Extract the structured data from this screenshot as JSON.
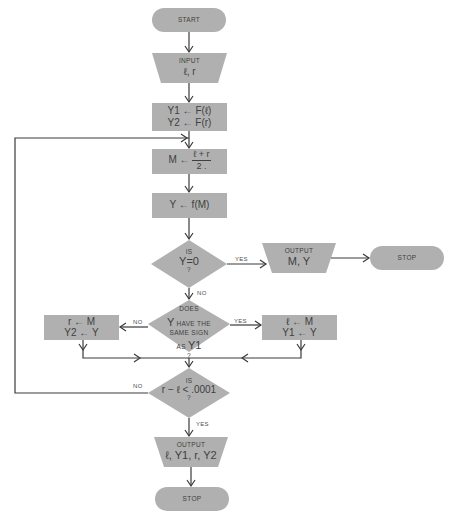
{
  "diagram": {
    "type": "flowchart",
    "colors": {
      "shape_fill": "#b0b0b0",
      "line": "#3a3a3a",
      "text": "#404040",
      "background": "#ffffff"
    },
    "nodes": {
      "start": {
        "shape": "terminal",
        "label": "START"
      },
      "input": {
        "shape": "trapezoid",
        "title": "INPUT",
        "value": "ℓ, r"
      },
      "init": {
        "shape": "process",
        "line1": "Y1 ← F(ℓ)",
        "line2": "Y2 ← F(r)"
      },
      "midpoint": {
        "shape": "process",
        "lhs": "M ←",
        "numerator": "ℓ + r",
        "denominator": "2 ."
      },
      "evaluate": {
        "shape": "process",
        "label": "Y ← f(M)"
      },
      "is_zero": {
        "shape": "decision",
        "top": "IS",
        "main": "Y=0",
        "bottom": "?"
      },
      "output_root": {
        "shape": "trapezoid",
        "title": "OUTPUT",
        "value": "M, Y"
      },
      "stop_root": {
        "shape": "terminal",
        "label": "STOP"
      },
      "same_sign": {
        "shape": "decision",
        "line1": "DOES",
        "line2_big": "Y",
        "line2": " HAVE THE",
        "line3": "SAME SIGN",
        "line4": "AS ",
        "line4_big": "Y1",
        "bottom": "?"
      },
      "update_right": {
        "shape": "process",
        "line1": "r ← M",
        "line2": "Y2 ← Y"
      },
      "update_left": {
        "shape": "process",
        "line1": "ℓ ← M",
        "line2": "Y1 ← Y"
      },
      "converged": {
        "shape": "decision",
        "top": "IS",
        "main": "r − ℓ < .0001",
        "bottom": "?"
      },
      "output_final": {
        "shape": "trapezoid",
        "title": "OUTPUT",
        "value": "ℓ, Y1, r, Y2"
      },
      "stop_final": {
        "shape": "terminal",
        "label": "STOP"
      }
    },
    "edge_labels": {
      "is_zero_yes": "YES",
      "is_zero_no": "NO",
      "same_sign_no": "NO",
      "same_sign_yes": "YES",
      "converged_no": "NO",
      "converged_yes": "YES"
    },
    "edges": [
      {
        "from": "start",
        "to": "input"
      },
      {
        "from": "input",
        "to": "init"
      },
      {
        "from": "init",
        "to": "midpoint"
      },
      {
        "from": "midpoint",
        "to": "evaluate"
      },
      {
        "from": "evaluate",
        "to": "is_zero"
      },
      {
        "from": "is_zero",
        "to": "output_root",
        "label": "YES"
      },
      {
        "from": "output_root",
        "to": "stop_root"
      },
      {
        "from": "is_zero",
        "to": "same_sign",
        "label": "NO"
      },
      {
        "from": "same_sign",
        "to": "update_right",
        "label": "NO"
      },
      {
        "from": "same_sign",
        "to": "update_left",
        "label": "YES"
      },
      {
        "from": "update_right",
        "to": "converged"
      },
      {
        "from": "update_left",
        "to": "converged"
      },
      {
        "from": "converged",
        "to": "midpoint",
        "label": "NO"
      },
      {
        "from": "converged",
        "to": "output_final",
        "label": "YES"
      },
      {
        "from": "output_final",
        "to": "stop_final"
      }
    ]
  }
}
